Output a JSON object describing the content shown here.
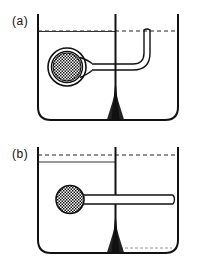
{
  "figure": {
    "type": "scientific-line-drawing",
    "background_color": "#ffffff",
    "ink_color": "#111111",
    "width": 205,
    "height": 266,
    "panels": [
      {
        "id": "a",
        "label": "(a)",
        "vessel": {
          "name": "divided-vessel",
          "outer_wall_color": "#111111",
          "partition": {
            "name": "central-partition",
            "description": "vertical divider with flared triangular base"
          }
        },
        "liquid": {
          "left_surface_style": "solid",
          "right_surface_style": "dashed",
          "reference_line_style": "dashed",
          "levels_equal": true
        },
        "probe": {
          "bulb": {
            "name": "hatched-bulb",
            "style": "double-ring-outline-with-crosshatch-fill",
            "fill_pattern": "checkered",
            "radius": 17
          },
          "tube": {
            "name": "bent-tube",
            "shape": "L-bend-upward",
            "end": "open-at-liquid-surface-right-compartment"
          }
        }
      },
      {
        "id": "b",
        "label": "(b)",
        "vessel": {
          "name": "divided-vessel",
          "outer_wall_color": "#111111",
          "partition": {
            "name": "central-partition",
            "description": "vertical divider with flared triangular base"
          }
        },
        "liquid": {
          "left_surface_style": "solid",
          "right_surface_style": "dashed",
          "reference_line_style": "dashed",
          "levels_equal": false,
          "left_level_lowered": true,
          "right_bottom_residue_style": "dashed"
        },
        "probe": {
          "bulb": {
            "name": "hatched-bulb",
            "style": "single-outline-with-crosshatch-fill",
            "fill_pattern": "checkered",
            "radius": 13
          },
          "tube": {
            "name": "straight-tube",
            "shape": "horizontal",
            "end": "open-at-right-wall"
          }
        }
      }
    ]
  }
}
